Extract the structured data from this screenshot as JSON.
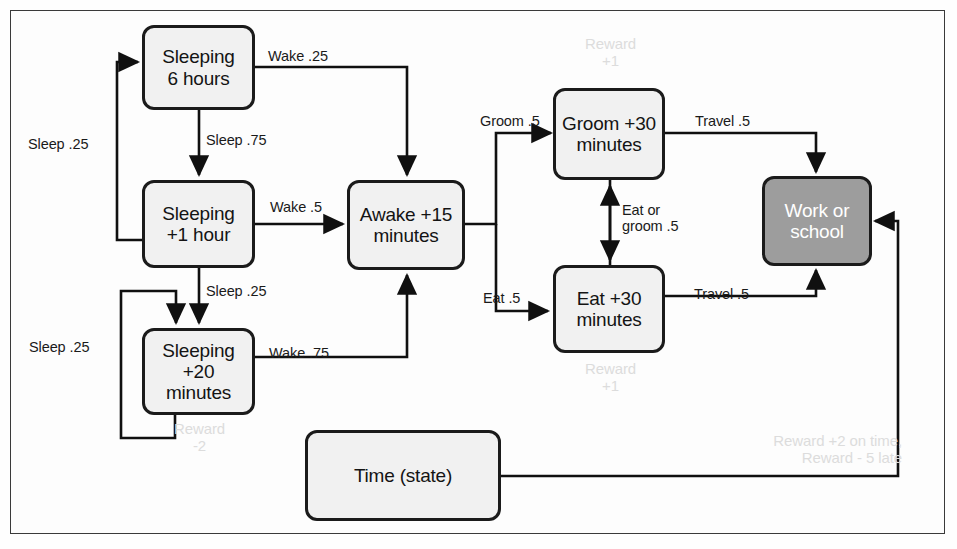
{
  "diagram": {
    "colors": {
      "node_fill": "#f1f1f1",
      "node_stroke": "#1b1b1b",
      "terminal_fill": "#9d9d9d",
      "terminal_text": "#ffffff",
      "ghost_text": "#dcdcdc",
      "frame_stroke": "#3a3a3a"
    },
    "nodes": [
      {
        "id": "sleep6",
        "label": "Sleeping\n6 hours",
        "style": "light"
      },
      {
        "id": "sleep1h",
        "label": "Sleeping\n+1 hour",
        "style": "light"
      },
      {
        "id": "sleep20",
        "label": "Sleeping\n+20\nminutes",
        "style": "light"
      },
      {
        "id": "awake",
        "label": "Awake +15\nminutes",
        "style": "light"
      },
      {
        "id": "groom",
        "label": "Groom +30\nminutes",
        "style": "light"
      },
      {
        "id": "eat",
        "label": "Eat +30\nminutes",
        "style": "light"
      },
      {
        "id": "work",
        "label": "Work or\nschool",
        "style": "dark"
      },
      {
        "id": "time",
        "label": "Time (state)",
        "style": "light"
      }
    ],
    "edges": [
      {
        "id": "e1",
        "from": "sleep6",
        "to": "awake",
        "label": "Wake .25"
      },
      {
        "id": "e2",
        "from": "sleep6",
        "to": "sleep1h",
        "label": "Sleep .75"
      },
      {
        "id": "e3",
        "from": "sleep1h",
        "to": "sleep6",
        "label": "Sleep .25"
      },
      {
        "id": "e4",
        "from": "sleep1h",
        "to": "awake",
        "label": "Wake .5"
      },
      {
        "id": "e5",
        "from": "sleep1h",
        "to": "sleep20",
        "label": "Sleep .25"
      },
      {
        "id": "e6",
        "from": "sleep20",
        "to": "sleep20",
        "label": "Sleep .25"
      },
      {
        "id": "e7",
        "from": "sleep20",
        "to": "awake",
        "label": "Wake .75"
      },
      {
        "id": "e8",
        "from": "awake",
        "to": "groom",
        "label": "Groom .5"
      },
      {
        "id": "e9",
        "from": "awake",
        "to": "eat",
        "label": "Eat .5"
      },
      {
        "id": "e10",
        "from": "groom",
        "to": "eat",
        "label": "Eat or\ngroom .5"
      },
      {
        "id": "e11",
        "from": "groom",
        "to": "work",
        "label": "Travel .5"
      },
      {
        "id": "e12",
        "from": "eat",
        "to": "work",
        "label": "Travel .5"
      },
      {
        "id": "e13",
        "from": "time",
        "to": "work",
        "label": ""
      }
    ],
    "rewards": [
      {
        "id": "r1",
        "node": "groom",
        "label": "Reward\n+1"
      },
      {
        "id": "r2",
        "node": "eat",
        "label": "Reward\n+1"
      },
      {
        "id": "r3",
        "node": "sleep20",
        "label": "Reward\n-2"
      },
      {
        "id": "r4",
        "node": "work",
        "label": "Reward +2 on time,\nReward - 5 late"
      }
    ]
  }
}
